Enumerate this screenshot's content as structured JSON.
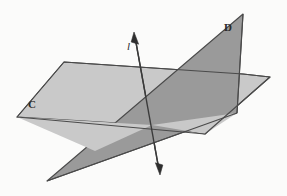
{
  "figure": {
    "canvas": {
      "width": 287,
      "height": 196
    },
    "background_color": "#fbfbfa",
    "stroke_color": "#4a4a4a",
    "text_color": "#2a2a2a"
  },
  "labels": {
    "plane_c": "C",
    "plane_d": "D",
    "line_l": "l"
  },
  "chart_data": {
    "type": "diagram",
    "elements": [
      {
        "name": "plane-c",
        "kind": "plane",
        "label": "C",
        "fill": "#c9c9c9",
        "stroke": "#4a4a4a",
        "points": "64,62 243,74 270,77 205,134 17,117",
        "description": "light gray horizontal plane extending left and right"
      },
      {
        "name": "plane-d",
        "kind": "plane",
        "label": "D",
        "fill": "#9a9a9a",
        "stroke": "#4a4a4a",
        "points": "243,14 237,113 47,181",
        "description": "dark gray tilted plane slicing through plane C"
      },
      {
        "name": "line-l",
        "kind": "line",
        "label": "l",
        "stroke": "#3a3a3a",
        "x1": 135,
        "y1": 37,
        "x2": 159,
        "y2": 170,
        "arrowheads": "both",
        "description": "line of intersection of planes C and D"
      },
      {
        "name": "intersection-point",
        "kind": "point",
        "x": 152,
        "y": 125,
        "description": "point where line l crosses plane C"
      }
    ],
    "xlabel": "",
    "ylabel": "",
    "grid": false,
    "legend": false
  }
}
